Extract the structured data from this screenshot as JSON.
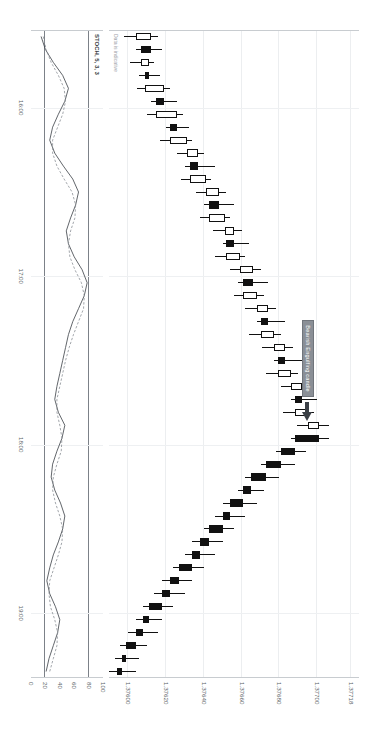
{
  "chart_data": {
    "type": "candlestick",
    "title": "",
    "instrument": "",
    "xlabel": "",
    "ylabel": "",
    "ylim": [
      1.3759,
      1.37722
    ],
    "y_ticks": [
      "1.37718",
      "1.37700",
      "1.37680",
      "1.37660",
      "1.37640",
      "1.37620",
      "1.37600"
    ],
    "y_tick_values": [
      1.37718,
      1.377,
      1.3768,
      1.3766,
      1.3764,
      1.3762,
      1.376
    ],
    "x_ticks": [
      "16:00",
      "17:00",
      "18:00",
      "19:00"
    ],
    "grid": true,
    "legend_position": "none",
    "notes": [
      {
        "text": "Bearish Engulfing candle",
        "points_to_index": 31
      }
    ],
    "candles": [
      {
        "o": 1.37604,
        "h": 1.37616,
        "l": 1.37598,
        "c": 1.37612
      },
      {
        "o": 1.37612,
        "h": 1.37618,
        "l": 1.37604,
        "c": 1.37607
      },
      {
        "o": 1.37607,
        "h": 1.37614,
        "l": 1.37601,
        "c": 1.37611
      },
      {
        "o": 1.37611,
        "h": 1.37617,
        "l": 1.37606,
        "c": 1.37609
      },
      {
        "o": 1.37609,
        "h": 1.37622,
        "l": 1.37605,
        "c": 1.37619
      },
      {
        "o": 1.37619,
        "h": 1.37626,
        "l": 1.37612,
        "c": 1.37615
      },
      {
        "o": 1.37615,
        "h": 1.37629,
        "l": 1.3761,
        "c": 1.37626
      },
      {
        "o": 1.37626,
        "h": 1.37632,
        "l": 1.3762,
        "c": 1.37622
      },
      {
        "o": 1.37622,
        "h": 1.37634,
        "l": 1.37617,
        "c": 1.37631
      },
      {
        "o": 1.37631,
        "h": 1.3764,
        "l": 1.37626,
        "c": 1.37637
      },
      {
        "o": 1.37637,
        "h": 1.37646,
        "l": 1.3763,
        "c": 1.37633
      },
      {
        "o": 1.37633,
        "h": 1.37644,
        "l": 1.37628,
        "c": 1.37641
      },
      {
        "o": 1.37641,
        "h": 1.37652,
        "l": 1.37636,
        "c": 1.37648
      },
      {
        "o": 1.37648,
        "h": 1.37656,
        "l": 1.3764,
        "c": 1.37643
      },
      {
        "o": 1.37643,
        "h": 1.37654,
        "l": 1.37638,
        "c": 1.37651
      },
      {
        "o": 1.37651,
        "h": 1.3766,
        "l": 1.37645,
        "c": 1.37656
      },
      {
        "o": 1.37656,
        "h": 1.37664,
        "l": 1.3765,
        "c": 1.37652
      },
      {
        "o": 1.37652,
        "h": 1.37662,
        "l": 1.37646,
        "c": 1.37659
      },
      {
        "o": 1.37659,
        "h": 1.3767,
        "l": 1.37654,
        "c": 1.37666
      },
      {
        "o": 1.37666,
        "h": 1.37674,
        "l": 1.37658,
        "c": 1.37661
      },
      {
        "o": 1.37661,
        "h": 1.37672,
        "l": 1.37656,
        "c": 1.37668
      },
      {
        "o": 1.37668,
        "h": 1.37678,
        "l": 1.37662,
        "c": 1.37674
      },
      {
        "o": 1.37674,
        "h": 1.37683,
        "l": 1.37668,
        "c": 1.3767
      },
      {
        "o": 1.3767,
        "h": 1.37681,
        "l": 1.37664,
        "c": 1.37677
      },
      {
        "o": 1.37677,
        "h": 1.37687,
        "l": 1.37671,
        "c": 1.37683
      },
      {
        "o": 1.37683,
        "h": 1.37692,
        "l": 1.37677,
        "c": 1.37679
      },
      {
        "o": 1.37679,
        "h": 1.3769,
        "l": 1.37673,
        "c": 1.37686
      },
      {
        "o": 1.37686,
        "h": 1.37696,
        "l": 1.37681,
        "c": 1.37692
      },
      {
        "o": 1.37692,
        "h": 1.377,
        "l": 1.37686,
        "c": 1.37688
      },
      {
        "o": 1.37688,
        "h": 1.37698,
        "l": 1.37682,
        "c": 1.37695
      },
      {
        "o": 1.37695,
        "h": 1.37706,
        "l": 1.37689,
        "c": 1.37701
      },
      {
        "o": 1.37701,
        "h": 1.37706,
        "l": 1.37686,
        "c": 1.37688
      },
      {
        "o": 1.37688,
        "h": 1.37694,
        "l": 1.37678,
        "c": 1.37681
      },
      {
        "o": 1.37681,
        "h": 1.37688,
        "l": 1.3767,
        "c": 1.37673
      },
      {
        "o": 1.37673,
        "h": 1.3768,
        "l": 1.37662,
        "c": 1.37665
      },
      {
        "o": 1.37665,
        "h": 1.37672,
        "l": 1.37658,
        "c": 1.37661
      },
      {
        "o": 1.37661,
        "h": 1.37668,
        "l": 1.3765,
        "c": 1.37654
      },
      {
        "o": 1.37654,
        "h": 1.37662,
        "l": 1.37646,
        "c": 1.3765
      },
      {
        "o": 1.3765,
        "h": 1.37656,
        "l": 1.3764,
        "c": 1.37643
      },
      {
        "o": 1.37643,
        "h": 1.3765,
        "l": 1.37634,
        "c": 1.37638
      },
      {
        "o": 1.37638,
        "h": 1.37646,
        "l": 1.3763,
        "c": 1.37634
      },
      {
        "o": 1.37634,
        "h": 1.3764,
        "l": 1.37624,
        "c": 1.37627
      },
      {
        "o": 1.37627,
        "h": 1.37634,
        "l": 1.37618,
        "c": 1.37622
      },
      {
        "o": 1.37622,
        "h": 1.3763,
        "l": 1.37614,
        "c": 1.37618
      },
      {
        "o": 1.37618,
        "h": 1.37624,
        "l": 1.37608,
        "c": 1.37611
      },
      {
        "o": 1.37611,
        "h": 1.37618,
        "l": 1.37604,
        "c": 1.37608
      },
      {
        "o": 1.37608,
        "h": 1.37616,
        "l": 1.376,
        "c": 1.37604
      },
      {
        "o": 1.37604,
        "h": 1.3761,
        "l": 1.37596,
        "c": 1.37599
      },
      {
        "o": 1.37599,
        "h": 1.37606,
        "l": 1.37593,
        "c": 1.37597
      },
      {
        "o": 1.37597,
        "h": 1.37604,
        "l": 1.3759,
        "c": 1.37594
      }
    ],
    "subchart": {
      "type": "line",
      "title": "STOCH, 5, 3, 3",
      "ylim": [
        0,
        100
      ],
      "y_ticks": [
        "100",
        "80",
        "60",
        "40",
        "20",
        "0"
      ],
      "y_tick_values": [
        100,
        80,
        60,
        40,
        20,
        0
      ],
      "bands": [
        80,
        20
      ],
      "series": [
        {
          "name": "%K",
          "style": "solid",
          "values": [
            14,
            20,
            31,
            44,
            52,
            47,
            38,
            30,
            26,
            33,
            45,
            58,
            66,
            62,
            55,
            49,
            52,
            60,
            71,
            78,
            74,
            66,
            58,
            52,
            48,
            44,
            40,
            36,
            33,
            38,
            47,
            43,
            36,
            30,
            28,
            33,
            41,
            47,
            44,
            38,
            31,
            26,
            22,
            26,
            34,
            40,
            37,
            31,
            25,
            21
          ]
        },
        {
          "name": "%D",
          "style": "dashed",
          "values": [
            17,
            21,
            28,
            38,
            46,
            48,
            44,
            37,
            30,
            30,
            36,
            46,
            57,
            62,
            61,
            55,
            52,
            54,
            61,
            70,
            74,
            73,
            66,
            59,
            53,
            48,
            44,
            40,
            36,
            36,
            40,
            43,
            42,
            36,
            31,
            30,
            34,
            40,
            44,
            43,
            38,
            32,
            26,
            25,
            27,
            33,
            37,
            36,
            31,
            26
          ]
        }
      ]
    }
  },
  "labels": {
    "data_disclaimer": "Data is indicative",
    "annotation": "Bearish Engulfing candle",
    "stoch_title": "STOCH, 5, 3, 3"
  }
}
